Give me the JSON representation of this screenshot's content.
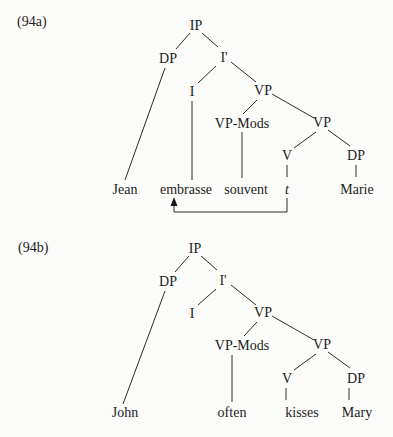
{
  "examples": [
    {
      "id_label": "(94a)",
      "nodes": {
        "ip": "IP",
        "dp": "DP",
        "ibar": "I'",
        "i": "I",
        "vp_upper": "VP",
        "vp_mods": "VP-Mods",
        "vp_lower": "VP",
        "v": "V",
        "dp_object": "DP"
      },
      "leaves": {
        "subject": "Jean",
        "verb_raised": "embrasse",
        "adverb": "souvent",
        "trace": "t",
        "object": "Marie"
      },
      "movement_arrow": {
        "from": "t",
        "to": "embrasse"
      }
    },
    {
      "id_label": "(94b)",
      "nodes": {
        "ip": "IP",
        "dp": "DP",
        "ibar": "I'",
        "i": "I",
        "vp_upper": "VP",
        "vp_mods": "VP-Mods",
        "vp_lower": "VP",
        "v": "V",
        "dp_object": "DP"
      },
      "leaves": {
        "subject": "John",
        "adverb": "often",
        "verb": "kisses",
        "object": "Mary"
      }
    }
  ]
}
